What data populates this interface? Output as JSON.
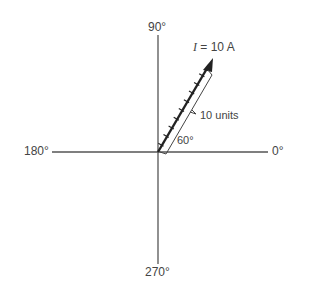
{
  "diagram": {
    "axis_labels": {
      "top": "90°",
      "right": "0°",
      "left": "180°",
      "bottom": "270°"
    },
    "phasor": {
      "label_var": "I",
      "label_rest": " = 10 A",
      "length_label": "10 units",
      "angle_label": "60°",
      "magnitude": 10,
      "angle_deg": 60,
      "ticks": 10
    },
    "colors": {
      "axis": "#555555",
      "phasor": "#222222"
    }
  }
}
